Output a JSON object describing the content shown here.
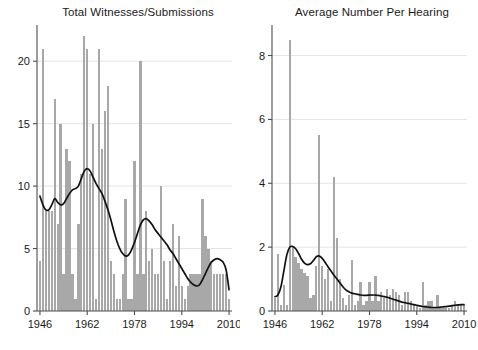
{
  "chart_data": [
    {
      "id": "total-witnesses",
      "type": "bar",
      "title": "Total Witnesses/Submissions",
      "xlabel": "",
      "ylabel": "",
      "xlim": [
        1945,
        2011
      ],
      "ylim": [
        0,
        22.5
      ],
      "yticks": [
        0,
        5,
        10,
        15,
        20
      ],
      "ytick_labels": [
        "0",
        "5",
        "10",
        "15",
        "20"
      ],
      "xticks": [
        1946,
        1962,
        1978,
        1994,
        2010
      ],
      "xtick_labels": [
        "1946",
        "1962",
        "1978",
        "1994",
        "2010"
      ],
      "grid": true,
      "bar_color": "#a8a8a8",
      "line_color": "#111111",
      "categories": [
        1946,
        1947,
        1948,
        1949,
        1950,
        1951,
        1952,
        1953,
        1954,
        1955,
        1956,
        1957,
        1958,
        1959,
        1960,
        1961,
        1962,
        1963,
        1964,
        1965,
        1966,
        1967,
        1968,
        1969,
        1970,
        1971,
        1972,
        1973,
        1974,
        1975,
        1976,
        1977,
        1978,
        1979,
        1980,
        1981,
        1982,
        1983,
        1984,
        1985,
        1986,
        1987,
        1988,
        1989,
        1990,
        1991,
        1992,
        1993,
        1994,
        1995,
        1996,
        1997,
        1998,
        1999,
        2000,
        2001,
        2002,
        2003,
        2004,
        2005,
        2006,
        2007,
        2008,
        2009,
        2010
      ],
      "values": [
        4,
        21,
        8,
        8,
        8,
        17,
        7,
        15,
        3,
        13,
        12,
        3,
        1,
        7,
        11,
        22,
        21,
        11,
        15,
        1,
        21,
        13,
        16,
        18,
        4,
        3,
        1,
        1,
        3,
        9,
        1,
        1,
        12,
        3,
        20,
        3,
        8,
        4,
        5,
        3,
        3,
        10,
        4,
        1,
        4,
        7,
        2,
        6,
        2,
        1,
        2,
        3,
        3,
        3,
        3,
        9,
        6,
        5,
        4,
        3,
        3,
        3,
        3,
        3,
        1
      ],
      "series": [
        {
          "name": "smoothed trend",
          "type": "line",
          "x": [
            1946,
            1947,
            1948,
            1949,
            1950,
            1951,
            1952,
            1953,
            1954,
            1955,
            1956,
            1957,
            1958,
            1959,
            1960,
            1961,
            1962,
            1963,
            1964,
            1965,
            1966,
            1967,
            1968,
            1969,
            1970,
            1971,
            1972,
            1973,
            1974,
            1975,
            1976,
            1977,
            1978,
            1979,
            1980,
            1981,
            1982,
            1983,
            1984,
            1985,
            1986,
            1987,
            1988,
            1989,
            1990,
            1991,
            1992,
            1993,
            1994,
            1995,
            1996,
            1997,
            1998,
            1999,
            2000,
            2001,
            2002,
            2003,
            2004,
            2005,
            2006,
            2007,
            2008,
            2009,
            2010
          ],
          "values": [
            9.2,
            8.5,
            8.1,
            8.1,
            8.5,
            9.0,
            8.7,
            8.5,
            8.6,
            9.0,
            9.4,
            9.7,
            9.8,
            10.0,
            10.6,
            11.2,
            11.4,
            11.2,
            10.7,
            10.2,
            9.8,
            9.4,
            8.8,
            8.1,
            7.3,
            6.4,
            5.6,
            5.0,
            4.6,
            4.4,
            4.5,
            4.9,
            5.5,
            6.2,
            6.9,
            7.3,
            7.4,
            7.2,
            6.9,
            6.5,
            6.2,
            5.9,
            5.6,
            5.3,
            4.9,
            4.6,
            4.2,
            3.8,
            3.4,
            3.0,
            2.6,
            2.3,
            2.1,
            2.0,
            2.1,
            2.5,
            3.0,
            3.5,
            3.9,
            4.1,
            4.2,
            4.1,
            3.9,
            3.3,
            1.7
          ]
        }
      ]
    },
    {
      "id": "average-per-hearing",
      "type": "bar",
      "title": "Average Number Per Hearing",
      "xlabel": "",
      "ylabel": "",
      "xlim": [
        1945,
        2011
      ],
      "ylim": [
        0,
        8.8
      ],
      "yticks": [
        0,
        2,
        4,
        6,
        8
      ],
      "ytick_labels": [
        "0",
        "2",
        "4",
        "6",
        "8"
      ],
      "xticks": [
        1946,
        1962,
        1978,
        1994,
        2010
      ],
      "xtick_labels": [
        "1946",
        "1962",
        "1978",
        "1994",
        "2010"
      ],
      "grid": true,
      "bar_color": "#a8a8a8",
      "line_color": "#111111",
      "categories": [
        1946,
        1947,
        1948,
        1949,
        1950,
        1951,
        1952,
        1953,
        1954,
        1955,
        1956,
        1957,
        1958,
        1959,
        1960,
        1961,
        1962,
        1963,
        1964,
        1965,
        1966,
        1967,
        1968,
        1969,
        1970,
        1971,
        1972,
        1973,
        1974,
        1975,
        1976,
        1977,
        1978,
        1979,
        1980,
        1981,
        1982,
        1983,
        1984,
        1985,
        1986,
        1987,
        1988,
        1989,
        1990,
        1991,
        1992,
        1993,
        1994,
        1995,
        1996,
        1997,
        1998,
        1999,
        2000,
        2001,
        2002,
        2003,
        2004,
        2005,
        2006,
        2007,
        2008,
        2009,
        2010
      ],
      "values": [
        0.4,
        1.8,
        0.2,
        0.8,
        0.2,
        8.5,
        2.0,
        1.7,
        1.5,
        1.3,
        1.2,
        1.1,
        0.4,
        0.5,
        1.4,
        5.5,
        1.4,
        1.0,
        1.3,
        0.3,
        4.2,
        2.3,
        1.0,
        0.4,
        0.2,
        0.5,
        1.6,
        0.2,
        0.3,
        0.9,
        0.2,
        0.3,
        0.9,
        0.3,
        1.1,
        0.3,
        0.6,
        0.4,
        0.7,
        0.5,
        0.7,
        0.6,
        0.5,
        0.2,
        0.6,
        0.6,
        0.3,
        0.2,
        0.2,
        0.1,
        0.9,
        0.2,
        0.3,
        0.3,
        0.1,
        0.5,
        0.1,
        0.1,
        0.1,
        0.1,
        0.2,
        0.3,
        0.2,
        0.2,
        0.2
      ],
      "series": [
        {
          "name": "smoothed trend",
          "type": "line",
          "x": [
            1946,
            1947,
            1948,
            1949,
            1950,
            1951,
            1952,
            1953,
            1954,
            1955,
            1956,
            1957,
            1958,
            1959,
            1960,
            1961,
            1962,
            1963,
            1964,
            1965,
            1966,
            1967,
            1968,
            1969,
            1970,
            1971,
            1972,
            1973,
            1974,
            1975,
            1976,
            1977,
            1978,
            1979,
            1980,
            1981,
            1982,
            1983,
            1984,
            1985,
            1986,
            1987,
            1988,
            1989,
            1990,
            1991,
            1992,
            1993,
            1994,
            1995,
            1996,
            1997,
            1998,
            1999,
            2000,
            2001,
            2002,
            2003,
            2004,
            2005,
            2006,
            2007,
            2008,
            2009,
            2010
          ],
          "values": [
            0.45,
            0.5,
            0.75,
            1.25,
            1.75,
            2.0,
            2.02,
            1.95,
            1.8,
            1.62,
            1.5,
            1.45,
            1.48,
            1.58,
            1.7,
            1.72,
            1.65,
            1.52,
            1.38,
            1.25,
            1.12,
            1.0,
            0.88,
            0.76,
            0.66,
            0.6,
            0.56,
            0.54,
            0.52,
            0.5,
            0.49,
            0.49,
            0.5,
            0.5,
            0.5,
            0.49,
            0.47,
            0.45,
            0.43,
            0.4,
            0.37,
            0.34,
            0.31,
            0.28,
            0.26,
            0.24,
            0.22,
            0.2,
            0.18,
            0.16,
            0.14,
            0.13,
            0.12,
            0.11,
            0.11,
            0.11,
            0.12,
            0.13,
            0.14,
            0.15,
            0.17,
            0.18,
            0.19,
            0.2,
            0.2
          ]
        }
      ]
    }
  ]
}
